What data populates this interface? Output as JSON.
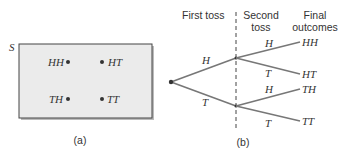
{
  "panel_a": {
    "set_label": "S",
    "outcomes": [
      {
        "label": "HH",
        "pos": "top-left"
      },
      {
        "label": "HT",
        "pos": "top-right"
      },
      {
        "label": "TH",
        "pos": "bottom-left"
      },
      {
        "label": "TT",
        "pos": "bottom-right"
      }
    ],
    "caption": "(a)",
    "box_fill": "#ebebeb"
  },
  "panel_b": {
    "headers": {
      "first": "First toss",
      "second_line1": "Second",
      "second_line2": "toss",
      "final_line1": "Final",
      "final_line2": "outcomes"
    },
    "first_branches": {
      "upper": "H",
      "lower": "T"
    },
    "second_branches": {
      "upper_upper": "H",
      "upper_lower": "T",
      "lower_upper": "H",
      "lower_lower": "T"
    },
    "final_outcomes": [
      "HH",
      "HT",
      "TH",
      "TT"
    ],
    "caption": "(b)",
    "line_color": "#777777"
  }
}
